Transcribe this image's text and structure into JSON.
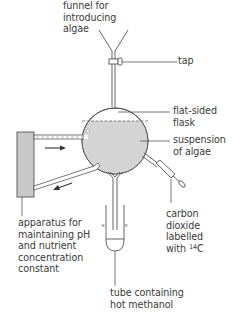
{
  "diagram": {
    "type": "apparatus",
    "colors": {
      "line": "#555555",
      "fill": "#d4d4d4",
      "box": "#c8c8c8",
      "background": "#ffffff"
    },
    "labels": {
      "funnel": "funnel for\nintroducing\nalgae",
      "tap": "tap",
      "flask": "flat-sided\nflask",
      "suspension": "suspension\nof algae",
      "co2_line1": "carbon\ndioxide\nlabelled\nwith ",
      "co2_isotope_sup": "14",
      "co2_isotope_el": "C",
      "apparatus": "apparatus for\nmaintaining pH\nand nutrient\nconcentration\nconstant",
      "tube": "tube containing\nhot methanol"
    },
    "flow_arrows": [
      "inflow-right",
      "outflow-left"
    ]
  }
}
